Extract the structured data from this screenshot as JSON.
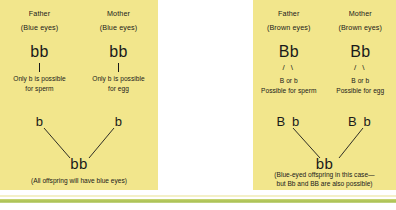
{
  "figure": {
    "type": "genetics-inheritance-diagram",
    "background_color": "#ffffff",
    "panel_color": "#f2e68c",
    "text_color": "#1a1a1a",
    "rule_color": "#a8bf4e"
  },
  "panels": [
    {
      "id": "blue-eyes-cross",
      "father": {
        "label": "Father",
        "eyes": "(Blue eyes)",
        "genotype": "bb",
        "note": "Only b is possible for sperm",
        "note_line1": "Only b is possible",
        "note_line2": "for sperm",
        "gamete": "b"
      },
      "mother": {
        "label": "Mother",
        "eyes": "(Blue eyes)",
        "genotype": "bb",
        "note": "Only b is possible for egg",
        "note_line1": "Only b is possible",
        "note_line2": "for egg",
        "gamete": "b"
      },
      "offspring": "bb",
      "caption": "(All offspring will have blue eyes)"
    },
    {
      "id": "brown-eyes-cross",
      "father": {
        "label": "Father",
        "eyes": "(Brown eyes)",
        "genotype": "Bb",
        "slashes": "/ \\",
        "alleles": "B or b",
        "note": "Possible for sperm",
        "gamete": "B b"
      },
      "mother": {
        "label": "Mother",
        "eyes": "(Brown eyes)",
        "genotype": "Bb",
        "slashes": "/ \\",
        "alleles": "B or b",
        "note": "Possible for egg",
        "gamete": "B b"
      },
      "offspring": "bb",
      "caption_line1": "(Blue-eyed offspring in this case—",
      "caption_line2": "but Bb and BB are also possible)"
    }
  ]
}
